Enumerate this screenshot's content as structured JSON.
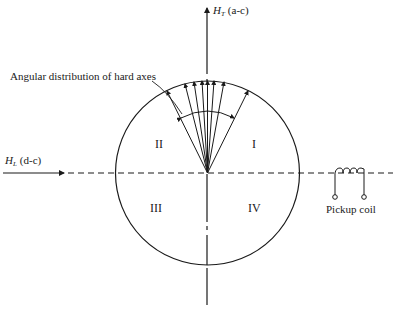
{
  "diagram": {
    "vertical_axis": {
      "symbol": "H",
      "subscript": "T",
      "label": "(a-c)"
    },
    "horizontal_axis": {
      "symbol": "H",
      "subscript": "L",
      "label": "(d-c)"
    },
    "annotation": "Angular distribution of hard axes",
    "quadrants": {
      "q1": "I",
      "q2": "II",
      "q3": "III",
      "q4": "IV"
    },
    "coil_label": "Pickup coil",
    "colors": {
      "ink": "#1a1a1a",
      "background": "#ffffff"
    }
  }
}
